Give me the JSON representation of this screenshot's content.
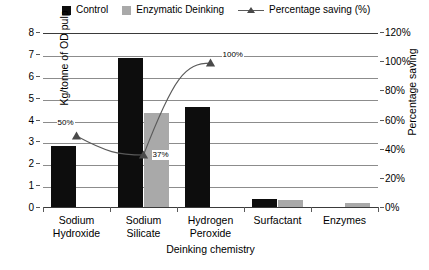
{
  "chart_data": {
    "type": "bar",
    "title": "",
    "xlabel": "Deinking chemistry",
    "ylabel": "Kg/tonne of OD pulp",
    "ylabel_secondary": "Percentage saving",
    "categories": [
      "Sodium Hydroxide",
      "Sodium Silicate",
      "Hydrogen Peroxide",
      "Surfactant",
      "Enzymes"
    ],
    "categories_wrapped": [
      [
        "Sodium",
        "Hydroxide"
      ],
      [
        "Sodium",
        "Silicate"
      ],
      [
        "Hydrogen",
        "Peroxide"
      ],
      [
        "Surfactant",
        ""
      ],
      [
        "Enzymes",
        ""
      ]
    ],
    "ylim": [
      0,
      8
    ],
    "yticks": [
      0,
      1,
      2,
      3,
      4,
      5,
      6,
      7,
      8
    ],
    "ytick_labels": [
      "0",
      "1",
      "2",
      "3",
      "4",
      "5",
      "6",
      "7",
      "8"
    ],
    "ylim_secondary": [
      0,
      120
    ],
    "yticks_secondary": [
      0,
      20,
      40,
      60,
      80,
      100,
      120
    ],
    "ytick_labels_secondary": [
      "0%",
      "20%",
      "40%",
      "60%",
      "80%",
      "100%",
      "120%"
    ],
    "grid": true,
    "legend_position": "top",
    "series": [
      {
        "name": "Control",
        "kind": "bar",
        "color": "#0d0d0d",
        "axis": "left",
        "values": [
          2.8,
          6.8,
          4.55,
          0.35,
          0
        ]
      },
      {
        "name": "Enzymatic Deinking",
        "kind": "bar",
        "color": "#a9a9a9",
        "axis": "left",
        "values": [
          0,
          4.3,
          0,
          0.3,
          0.2
        ]
      },
      {
        "name": "Percentage saving (%)",
        "kind": "line",
        "color": "#5a5a5a",
        "marker": "triangle",
        "axis": "right",
        "values": [
          50,
          37,
          100,
          null,
          null
        ],
        "point_labels": [
          "50%",
          "37%",
          "100%",
          "",
          ""
        ]
      }
    ]
  },
  "legend": {
    "items": [
      {
        "label": "Control",
        "swatch": "control"
      },
      {
        "label": "Enzymatic Deinking",
        "swatch": "enzymatic"
      },
      {
        "label": "Percentage saving (%)",
        "swatch": "line-marker"
      }
    ]
  }
}
